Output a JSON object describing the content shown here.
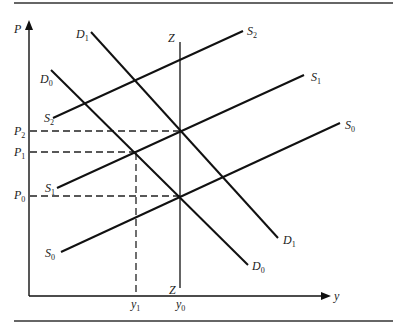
{
  "diagram": {
    "type": "supply-demand-shift",
    "axes": {
      "y_axis_label": "P",
      "x_axis_label": "y"
    },
    "price_levels": [
      {
        "label": "P",
        "sub": "2"
      },
      {
        "label": "P",
        "sub": "1"
      },
      {
        "label": "P",
        "sub": "0"
      }
    ],
    "quantity_levels": [
      {
        "label": "y",
        "sub": "1"
      },
      {
        "label": "y",
        "sub": "0"
      }
    ],
    "curves": {
      "S2": {
        "label": "S",
        "sub": "2"
      },
      "S1": {
        "label": "S",
        "sub": "1"
      },
      "S0": {
        "label": "S",
        "sub": "0"
      },
      "D1": {
        "label": "D",
        "sub": "1"
      },
      "D0": {
        "label": "D",
        "sub": "0"
      },
      "Z": {
        "label": "Z"
      }
    }
  }
}
